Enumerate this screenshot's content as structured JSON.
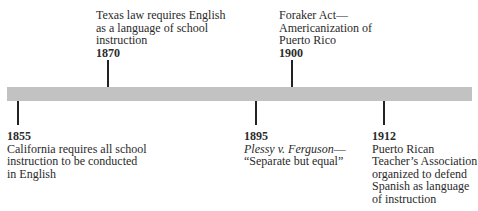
{
  "timeline": {
    "bar_color": "#c2c2c2",
    "events": [
      {
        "year": "1855",
        "description": "California requires all school instruction to be conducted in English",
        "lines": [
          "California requires all school",
          "instruction to be conducted",
          "in English"
        ],
        "position": "below"
      },
      {
        "year": "1870",
        "description": "Texas law requires English as a language of school instruction",
        "lines": [
          "Texas law requires English",
          "as a language of school",
          "instruction"
        ],
        "position": "above"
      },
      {
        "year": "1895",
        "description_italic": "Plessy v. Ferguson",
        "lines": [
          "—",
          "“Separate but equal”"
        ],
        "position": "below"
      },
      {
        "year": "1900",
        "description": "Foraker Act—Americanization of Puerto Rico",
        "lines": [
          "Foraker Act—",
          "Americanization of",
          "Puerto Rico"
        ],
        "position": "above"
      },
      {
        "year": "1912",
        "description": "Puerto Rican Teacher’s Association organized to defend Spanish as language of instruction",
        "lines": [
          "Puerto Rican",
          "Teacher’s Association",
          "organized to defend",
          "Spanish as language",
          "of instruction"
        ],
        "position": "below"
      }
    ]
  }
}
